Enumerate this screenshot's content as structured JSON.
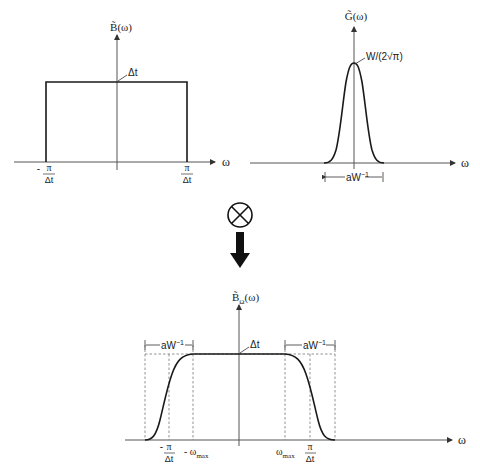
{
  "top_left_plot": {
    "y_label": "B̃(ω)",
    "x_label": "ω",
    "peak_label": "Δt",
    "tick_left_num": "π",
    "tick_left_prefix": "-",
    "tick_left_den": "Δt",
    "tick_right_num": "π",
    "tick_right_den": "Δt"
  },
  "top_right_plot": {
    "y_label": "G̃(ω)",
    "x_label": "ω",
    "peak_label": "W/(2√π)",
    "width_label_base": "aW",
    "width_label_exp": "−1"
  },
  "operator": {
    "symbol": "⊗",
    "name": "convolution",
    "arrow": "down"
  },
  "bottom_plot": {
    "y_label_base": "B̃",
    "y_label_sub": "Ω",
    "y_label_suffix": "(ω)",
    "x_label": "ω",
    "plateau_label": "Δt",
    "left_width_label_base": "aW",
    "left_width_label_exp": "−1",
    "right_width_label_base": "aW",
    "right_width_label_exp": "−1",
    "tick_neg_pi_prefix": "-",
    "tick_neg_pi_num": "π",
    "tick_neg_pi_den": "Δt",
    "tick_neg_wmax": "- ω",
    "tick_neg_wmax_sub": "max",
    "tick_wmax": "ω",
    "tick_wmax_sub": "max",
    "tick_pi_num": "π",
    "tick_pi_den": "Δt"
  }
}
